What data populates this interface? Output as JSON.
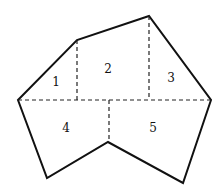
{
  "diagram": {
    "type": "polygon-partition",
    "regions": [
      {
        "id": "1",
        "label": "1"
      },
      {
        "id": "2",
        "label": "2"
      },
      {
        "id": "3",
        "label": "3"
      },
      {
        "id": "4",
        "label": "4"
      },
      {
        "id": "5",
        "label": "5"
      }
    ],
    "colors": {
      "outline": "#111111",
      "dashed": "#222222",
      "background": "#ffffff"
    }
  }
}
